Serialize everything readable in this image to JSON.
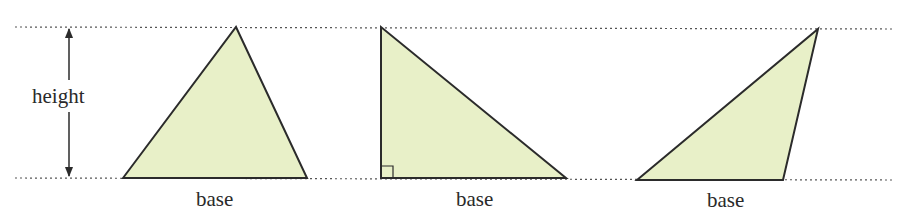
{
  "diagram": {
    "colors": {
      "fill": "#e8f0c8",
      "stroke": "#2b2b2b",
      "guide": "#555555"
    },
    "guides": {
      "top_y": 27,
      "bottom_y": 178
    },
    "height_label": "height",
    "triangles": [
      {
        "name": "acute-triangle",
        "base_label": "base",
        "points": "123,178 236,27 307,178"
      },
      {
        "name": "right-triangle",
        "base_label": "base",
        "points": "381,27 381,178 566,178",
        "right_angle_marker": true
      },
      {
        "name": "obtuse-triangle",
        "base_label": "base",
        "points": "637,180 818,29 783,180"
      }
    ]
  }
}
